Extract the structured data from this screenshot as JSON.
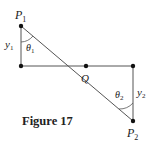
{
  "figure": {
    "caption": "Figure 17",
    "points": {
      "P1": {
        "label": "P",
        "sub": "1"
      },
      "Q": {
        "label": "Q"
      },
      "P2": {
        "label": "P",
        "sub": "2"
      }
    },
    "lengths": {
      "y1": {
        "label": "y",
        "sub": "1"
      },
      "y2": {
        "label": "y",
        "sub": "2"
      }
    },
    "angles": {
      "theta1": {
        "label": "θ",
        "sub": "1"
      },
      "theta2": {
        "label": "θ",
        "sub": "2"
      }
    },
    "colors": {
      "line": "#555555",
      "dot": "#111111",
      "text": "#222222"
    }
  }
}
